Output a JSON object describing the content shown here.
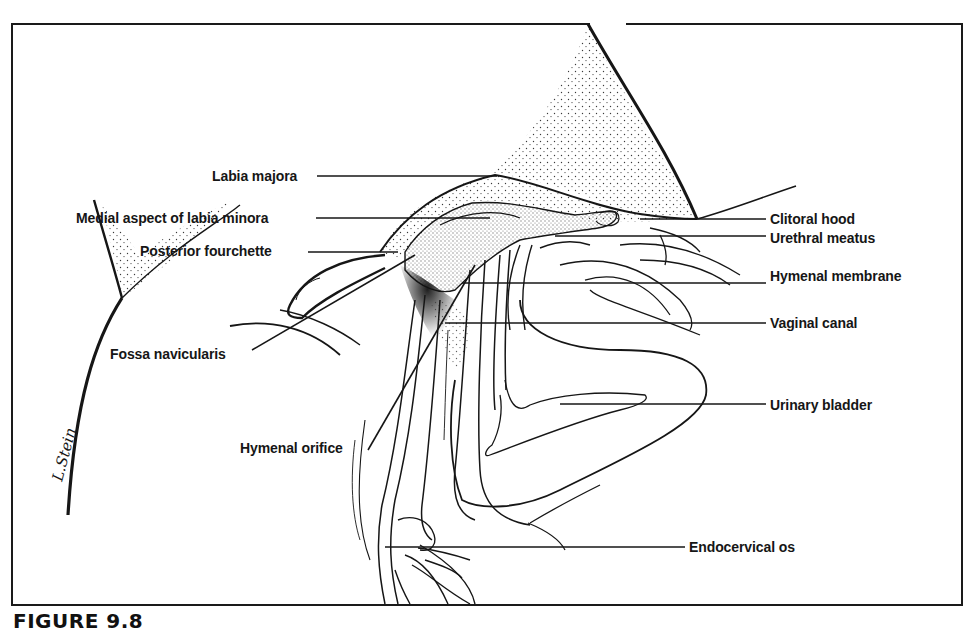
{
  "figure": {
    "caption": "FIGURE 9.8",
    "artist_signature": "L.Stein",
    "colors": {
      "ink": "#161616",
      "background": "#ffffff",
      "stipple": "#3a3a3a"
    }
  },
  "labels": {
    "labia_majora": "Labia majora",
    "medial_labia_minora": "Medial aspect of labia minora",
    "posterior_fourchette": "Posterior fourchette",
    "fossa_navicularis": "Fossa navicularis",
    "hymenal_orifice": "Hymenal orifice",
    "clitoral_hood": "Clitoral hood",
    "urethral_meatus": "Urethral meatus",
    "hymenal_membrane": "Hymenal membrane",
    "vaginal_canal": "Vaginal canal",
    "urinary_bladder": "Urinary bladder",
    "endocervical_os": "Endocervical os"
  }
}
